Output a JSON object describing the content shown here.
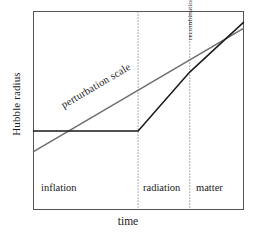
{
  "figure": {
    "title": "",
    "axis": {
      "ylabel": "Hubble radius",
      "xlabel": "time"
    },
    "era_labels": {
      "inflation": "inflation",
      "radiation": "radiation",
      "matter": "matter"
    },
    "annotations": {
      "perturbation_scale": "perturbation scale",
      "recombination": "recombination"
    },
    "colors": {
      "hubble_radius_line": "#1a1a1a",
      "perturbation_scale_line": "#6e6e6e",
      "frame": "#555555",
      "era_divider": "#777777",
      "background": "#ffffff"
    }
  },
  "chart_data": {
    "type": "line",
    "title": "",
    "xlabel": "time",
    "ylabel": "Hubble radius",
    "xlim": [
      0,
      1
    ],
    "ylim": [
      0,
      1
    ],
    "grid": false,
    "legend": "none",
    "axis_ticks": {
      "x": [],
      "y": []
    },
    "series": [
      {
        "name": "Hubble radius",
        "color": "#1a1a1a",
        "style": "solid",
        "points": [
          {
            "x": 0.0,
            "y": 0.397
          },
          {
            "x": 0.498,
            "y": 0.397
          },
          {
            "x": 0.744,
            "y": 0.694
          },
          {
            "x": 1.0,
            "y": 0.945
          }
        ]
      },
      {
        "name": "perturbation scale",
        "color": "#6e6e6e",
        "style": "solid",
        "points": [
          {
            "x": 0.0,
            "y": 0.292
          },
          {
            "x": 1.0,
            "y": 0.915
          }
        ]
      }
    ],
    "vertical_markers": [
      {
        "label": "",
        "x": 0.498,
        "style": "dotted",
        "color": "#777777"
      },
      {
        "label": "recombination",
        "x": 0.744,
        "style": "dotted",
        "color": "#777777"
      }
    ],
    "regions": [
      {
        "label": "inflation",
        "x0": 0.0,
        "x1": 0.498
      },
      {
        "label": "radiation",
        "x0": 0.498,
        "x1": 0.744
      },
      {
        "label": "matter",
        "x0": 0.744,
        "x1": 1.0
      }
    ],
    "annotations": [
      {
        "text": "perturbation scale",
        "along_series": "perturbation scale",
        "rotation_deg": -30.5
      },
      {
        "text": "recombination",
        "at_x": 0.744,
        "rotation_deg": -90
      }
    ]
  }
}
